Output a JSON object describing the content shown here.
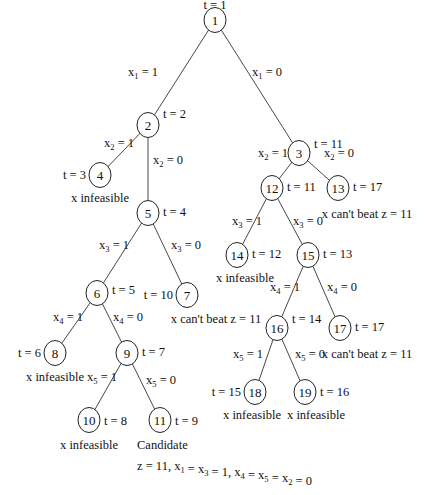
{
  "diagram": {
    "type": "branch-and-bound tree",
    "nodes": [
      {
        "id": "1",
        "x": 215,
        "y": 20,
        "t": "t = 1",
        "t_pos": [
          215,
          9,
          "middle"
        ],
        "note": ""
      },
      {
        "id": "2",
        "x": 148,
        "y": 125,
        "t": "t = 2",
        "t_pos": [
          163,
          118,
          "start"
        ],
        "note": ""
      },
      {
        "id": "3",
        "x": 299,
        "y": 153,
        "t": "t = 11",
        "t_pos": [
          314,
          148,
          "start"
        ],
        "note": ""
      },
      {
        "id": "4",
        "x": 100,
        "y": 175,
        "t": "t = 3",
        "t_pos": [
          86,
          179,
          "end"
        ],
        "note": "x infeasible",
        "note_pos": [
          100,
          202
        ]
      },
      {
        "id": "5",
        "x": 148,
        "y": 213,
        "t": "t = 4",
        "t_pos": [
          163,
          216,
          "start"
        ],
        "note": ""
      },
      {
        "id": "6",
        "x": 97,
        "y": 293,
        "t": "t = 5",
        "t_pos": [
          112,
          294,
          "start"
        ],
        "note": ""
      },
      {
        "id": "7",
        "x": 187,
        "y": 295,
        "t": "t = 10",
        "t_pos": [
          173,
          299,
          "end"
        ],
        "note": "x can't beat z = 11",
        "note_pos": [
          216,
          323
        ]
      },
      {
        "id": "8",
        "x": 55,
        "y": 353,
        "t": "t = 6",
        "t_pos": [
          41,
          357,
          "end"
        ],
        "note": "x infeasible",
        "note_pos": [
          55,
          381
        ]
      },
      {
        "id": "9",
        "x": 127,
        "y": 353,
        "t": "t = 7",
        "t_pos": [
          142,
          356,
          "start"
        ],
        "note": ""
      },
      {
        "id": "10",
        "x": 89,
        "y": 420,
        "t": "t = 8",
        "t_pos": [
          104,
          425,
          "start"
        ],
        "note": "x infeasible",
        "note_pos": [
          89,
          449
        ]
      },
      {
        "id": "11",
        "x": 160,
        "y": 420,
        "t": "t = 9",
        "t_pos": [
          175,
          425,
          "start"
        ],
        "note": "Candidate",
        "note_pos": [
          137,
          449,
          "start"
        ]
      },
      {
        "id": "12",
        "x": 272,
        "y": 188,
        "t": "t = 11",
        "t_pos": [
          287,
          191,
          "start"
        ],
        "note": ""
      },
      {
        "id": "13",
        "x": 338,
        "y": 188,
        "t": "t = 17",
        "t_pos": [
          353,
          191,
          "start"
        ],
        "note": "x can't beat z = 11",
        "note_pos": [
          367,
          218
        ]
      },
      {
        "id": "14",
        "x": 237,
        "y": 255,
        "t": "t = 12",
        "t_pos": [
          252,
          258,
          "start"
        ],
        "note": "x infeasible",
        "note_pos": [
          245,
          282
        ]
      },
      {
        "id": "15",
        "x": 308,
        "y": 255,
        "t": "t = 13",
        "t_pos": [
          323,
          258,
          "start"
        ],
        "note": ""
      },
      {
        "id": "16",
        "x": 277,
        "y": 328,
        "t": "t = 14",
        "t_pos": [
          292,
          323,
          "start"
        ],
        "note": ""
      },
      {
        "id": "17",
        "x": 340,
        "y": 328,
        "t": "t = 17",
        "t_pos": [
          355,
          331,
          "start"
        ],
        "note": "x can't beat z = 11",
        "note_pos": [
          367,
          358
        ]
      },
      {
        "id": "18",
        "x": 255,
        "y": 392,
        "t": "t = 15",
        "t_pos": [
          241,
          396,
          "end"
        ],
        "note": "x infeasible",
        "note_pos": [
          252,
          419
        ]
      },
      {
        "id": "19",
        "x": 305,
        "y": 392,
        "t": "t = 16",
        "t_pos": [
          320,
          396,
          "start"
        ],
        "note": "x infeasible",
        "note_pos": [
          316,
          419
        ]
      }
    ],
    "edges": [
      {
        "from": "1",
        "to": "2",
        "var": "x",
        "sub": "1",
        "val": "= 1",
        "label_pos": [
          128,
          76,
          "start"
        ]
      },
      {
        "from": "1",
        "to": "3",
        "var": "x",
        "sub": "1",
        "val": "= 0",
        "label_pos": [
          252,
          76,
          "start"
        ]
      },
      {
        "from": "2",
        "to": "4",
        "var": "x",
        "sub": "2",
        "val": "= 1",
        "label_pos": [
          104,
          147,
          "start"
        ]
      },
      {
        "from": "2",
        "to": "5",
        "var": "x",
        "sub": "2",
        "val": "= 0",
        "label_pos": [
          153,
          164,
          "start"
        ]
      },
      {
        "from": "3",
        "to": "12",
        "var": "x",
        "sub": "2",
        "val": "= 1",
        "label_pos": [
          258,
          157,
          "start"
        ]
      },
      {
        "from": "3",
        "to": "13",
        "var": "x",
        "sub": "2",
        "val": "= 0",
        "label_pos": [
          324,
          157,
          "start"
        ]
      },
      {
        "from": "5",
        "to": "6",
        "var": "x",
        "sub": "3",
        "val": "= 1",
        "label_pos": [
          99,
          249,
          "start"
        ]
      },
      {
        "from": "5",
        "to": "7",
        "var": "x",
        "sub": "3",
        "val": "= 0",
        "label_pos": [
          171,
          249,
          "start"
        ]
      },
      {
        "from": "12",
        "to": "14",
        "var": "x",
        "sub": "3",
        "val": "= 1",
        "label_pos": [
          232,
          225,
          "start"
        ]
      },
      {
        "from": "12",
        "to": "15",
        "var": "x",
        "sub": "3",
        "val": "= 0",
        "label_pos": [
          293,
          225,
          "start"
        ]
      },
      {
        "from": "6",
        "to": "8",
        "var": "x",
        "sub": "4",
        "val": "= 1",
        "label_pos": [
          53,
          321,
          "start"
        ]
      },
      {
        "from": "6",
        "to": "9",
        "var": "x",
        "sub": "4",
        "val": "= 0",
        "label_pos": [
          113,
          321,
          "start"
        ]
      },
      {
        "from": "15",
        "to": "16",
        "var": "x",
        "sub": "4",
        "val": "= 1",
        "label_pos": [
          270,
          291,
          "start"
        ]
      },
      {
        "from": "15",
        "to": "17",
        "var": "x",
        "sub": "4",
        "val": "= 0",
        "label_pos": [
          327,
          291,
          "start"
        ]
      },
      {
        "from": "9",
        "to": "10",
        "var": "x",
        "sub": "5",
        "val": "= 1",
        "label_pos": [
          87,
          381,
          "start"
        ]
      },
      {
        "from": "9",
        "to": "11",
        "var": "x",
        "sub": "5",
        "val": "= 0",
        "label_pos": [
          146,
          384,
          "start"
        ]
      },
      {
        "from": "16",
        "to": "18",
        "var": "x",
        "sub": "5",
        "val": "= 1",
        "label_pos": [
          233,
          358,
          "start"
        ]
      },
      {
        "from": "16",
        "to": "19",
        "var": "x",
        "sub": "5",
        "val": "= 0",
        "label_pos": [
          295,
          358,
          "start"
        ]
      }
    ],
    "solution": {
      "text_parts": [
        {
          "t": "z = 11, x",
          "sub": "1"
        },
        {
          "t": " = x",
          "sub": "3"
        },
        {
          "t": " = 1, x",
          "sub": "4"
        },
        {
          "t": " = x",
          "sub": "5"
        },
        {
          "t": " = x",
          "sub": "2"
        },
        {
          "t": " = 0",
          "sub": ""
        }
      ],
      "pos": [
        137,
        470
      ]
    },
    "node_radius": 11,
    "colors": {
      "line": "#333333",
      "text": "#111111",
      "background": "#ffffff"
    }
  }
}
